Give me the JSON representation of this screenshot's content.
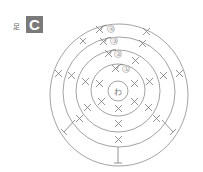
{
  "figure": {
    "part_label": "足",
    "part_letter": "C",
    "center_label": "わ",
    "round_numbers": [
      "①",
      "②",
      "③",
      "④"
    ],
    "colors": {
      "line": "#8a8a8a",
      "badge": "#7a7a7a",
      "background": "#ffffff"
    }
  }
}
